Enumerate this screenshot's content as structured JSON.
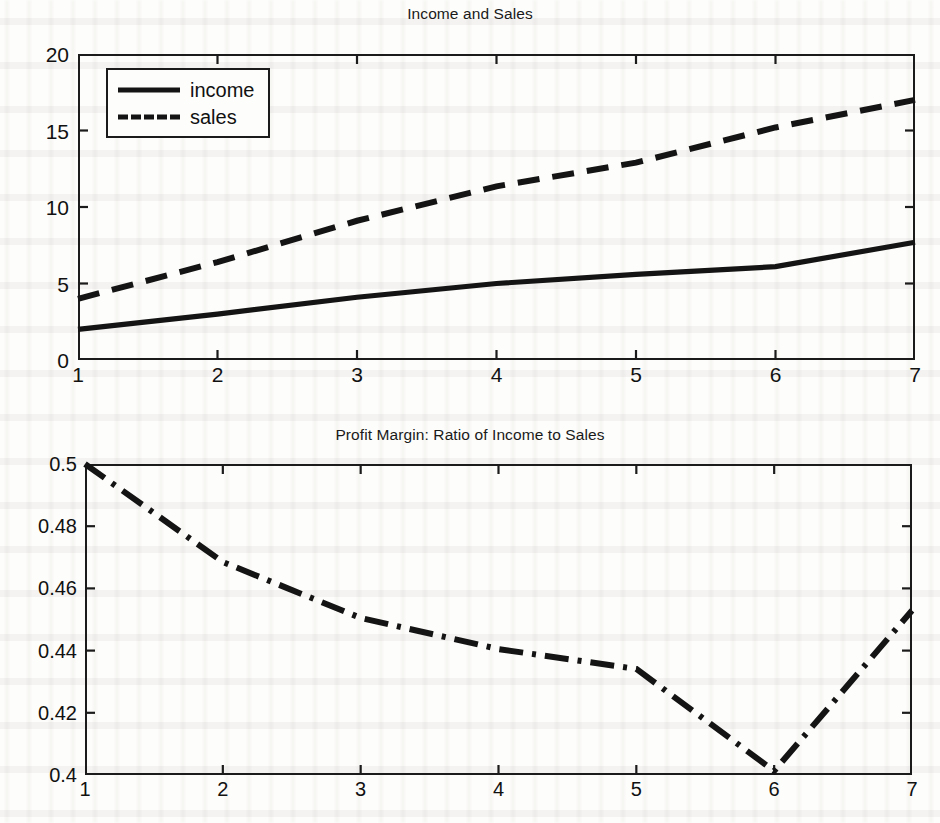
{
  "page": {
    "background": "#fdfdfb",
    "ink": "#141414",
    "width": 940,
    "height": 823
  },
  "figures": [
    {
      "id": "income-and-sales",
      "title": "Income and Sales",
      "legend": [
        {
          "label": "income",
          "style": "solid"
        },
        {
          "label": "sales",
          "style": "dashed"
        }
      ],
      "xticks": [
        "1",
        "2",
        "3",
        "4",
        "5",
        "6",
        "7"
      ],
      "yticks": [
        "0",
        "5",
        "10",
        "15",
        "20"
      ]
    },
    {
      "id": "profit-margin",
      "title": "Profit Margin: Ratio of Income to Sales",
      "xticks": [
        "1",
        "2",
        "3",
        "4",
        "5",
        "6",
        "7"
      ],
      "yticks": [
        "0.4",
        "0.42",
        "0.44",
        "0.46",
        "0.48",
        "0.5"
      ]
    }
  ],
  "chart_data": [
    {
      "type": "line",
      "title": "Income and Sales",
      "xlabel": "",
      "ylabel": "",
      "x": [
        1,
        2,
        3,
        4,
        5,
        6,
        7
      ],
      "xlim": [
        1,
        7
      ],
      "ylim": [
        0,
        20
      ],
      "xticks": [
        1,
        2,
        3,
        4,
        5,
        6,
        7
      ],
      "yticks": [
        0,
        5,
        10,
        15,
        20
      ],
      "grid": false,
      "legend_position": "upper-left-inside",
      "series": [
        {
          "name": "income",
          "style": "solid",
          "color": "#141414",
          "values": [
            2.0,
            3.0,
            4.1,
            5.0,
            5.6,
            6.1,
            7.7
          ]
        },
        {
          "name": "sales",
          "style": "dashed",
          "color": "#141414",
          "values": [
            4.0,
            6.4,
            9.1,
            11.35,
            12.9,
            15.2,
            17.0
          ]
        }
      ]
    },
    {
      "type": "line",
      "title": "Profit Margin: Ratio of Income to Sales",
      "xlabel": "",
      "ylabel": "",
      "x": [
        1,
        2,
        3,
        4,
        5,
        6,
        7
      ],
      "xlim": [
        1,
        7
      ],
      "ylim": [
        0.4,
        0.5
      ],
      "xticks": [
        1,
        2,
        3,
        4,
        5,
        6,
        7
      ],
      "yticks": [
        0.4,
        0.42,
        0.44,
        0.46,
        0.48,
        0.5
      ],
      "grid": false,
      "legend_position": "none",
      "series": [
        {
          "name": "income/sales",
          "style": "dash-dot",
          "color": "#141414",
          "values": [
            0.5,
            0.4685,
            0.4505,
            0.4405,
            0.4341,
            0.4013,
            0.4529
          ]
        }
      ]
    }
  ]
}
